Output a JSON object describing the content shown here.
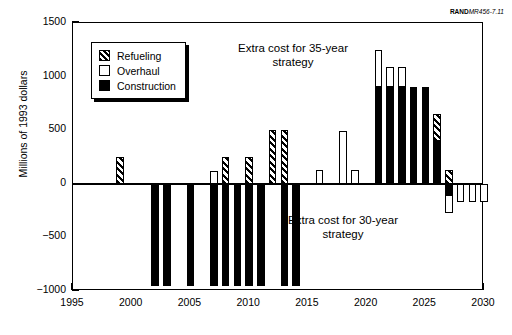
{
  "credit": {
    "brand": "RAND",
    "doc_id": "MR456-7.11"
  },
  "legend": {
    "position": "upper-left-inside",
    "items": [
      {
        "label": "Refueling",
        "key": "refueling",
        "swatch": "hatched-black-diagonal"
      },
      {
        "label": "Overhaul",
        "key": "overhaul",
        "swatch": "white-open"
      },
      {
        "label": "Construction",
        "key": "construction",
        "swatch": "solid-black"
      }
    ]
  },
  "annotations": [
    {
      "name": "annotation-35-year",
      "text": "Extra cost for 35-year\nstrategy"
    },
    {
      "name": "annotation-30-year",
      "text": "Extra cost for 30-year\nstrategy"
    }
  ],
  "chart_data": {
    "type": "bar",
    "subtype": "stacked-diverging",
    "title": "",
    "xlabel": "",
    "ylabel": "Millions of 1993 dollars",
    "xlim": [
      1995,
      2030
    ],
    "ylim": [
      -1000,
      1500
    ],
    "yticks": [
      -1000,
      -500,
      0,
      500,
      1000,
      1500
    ],
    "ytick_labels": [
      "−1000",
      "−500",
      "0",
      "500",
      "1000",
      "1500"
    ],
    "xticks": [
      1995,
      2000,
      2005,
      2010,
      2015,
      2020,
      2025,
      2030
    ],
    "xtick_labels": [
      "1995",
      "2000",
      "2005",
      "2010",
      "2015",
      "2020",
      "2025",
      "2030"
    ],
    "grid": false,
    "legend_position": "upper left",
    "categories": [
      1999,
      2002,
      2003,
      2005,
      2007,
      2008,
      2009,
      2010,
      2011,
      2012,
      2013,
      2014,
      2016,
      2018,
      2019,
      2020,
      2021,
      2022,
      2023,
      2024,
      2025,
      2026,
      2027,
      2028,
      2029
    ],
    "series": [
      {
        "name": "Refueling",
        "key": "refueling",
        "color": "#000000",
        "fill": "hatched",
        "values": {
          "1999": 250,
          "2008": 250,
          "2010": 250,
          "2012": 500,
          "2013": 500,
          "2026": 250,
          "2027": 130
        }
      },
      {
        "name": "Overhaul",
        "key": "overhaul",
        "color": "#ffffff",
        "fill": "open",
        "values": {
          "2007": 120,
          "2016": 130,
          "2018": 490,
          "2019": 130,
          "2021": 350,
          "2022": 190,
          "2023": 190,
          "2027": -170,
          "2028": -170,
          "2029": -170,
          "2030": -170
        }
      },
      {
        "name": "Construction",
        "key": "construction",
        "color": "#000000",
        "fill": "solid",
        "values": {
          "2002": -950,
          "2003": -950,
          "2005": -950,
          "2007": -950,
          "2008": -950,
          "2009": -950,
          "2010": -950,
          "2011": -950,
          "2013": -950,
          "2014": -950,
          "2021": 900,
          "2022": 900,
          "2023": 900,
          "2024": 900,
          "2025": 900,
          "2026": 400,
          "2027": -100
        }
      }
    ]
  }
}
